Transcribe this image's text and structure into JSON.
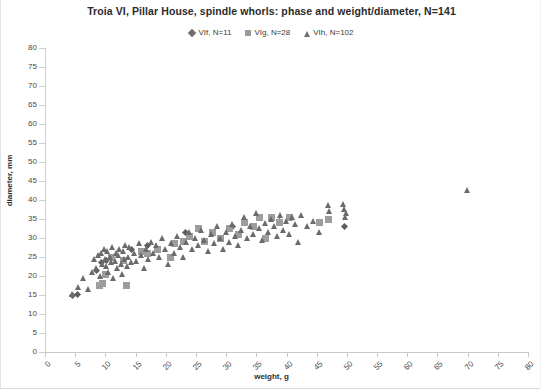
{
  "chart_data": {
    "type": "scatter",
    "title": "Troia VI, Pillar House, spindle whorls: phase and weight/diameter, N=141",
    "xlabel": "weight, g",
    "ylabel": "diameter, mm",
    "xlim": [
      0,
      80
    ],
    "ylim": [
      0,
      80
    ],
    "xticks": [
      0,
      5,
      10,
      15,
      20,
      25,
      30,
      35,
      40,
      45,
      50,
      55,
      60,
      65,
      70,
      75,
      80
    ],
    "yticks": [
      0,
      5,
      10,
      15,
      20,
      25,
      30,
      35,
      40,
      45,
      50,
      55,
      60,
      65,
      70,
      75,
      80
    ],
    "grid": false,
    "legend_position": "top-center",
    "colors": {
      "VIf": "#5d5d5d",
      "VIg": "#9d9d9d",
      "VIh": "#6b6b6b"
    },
    "series": [
      {
        "name": "VIf, N=11",
        "label": "VIf",
        "count": 11,
        "marker": "diamond",
        "color": "#5d5d5d",
        "points": [
          [
            4.6,
            15.0
          ],
          [
            5.4,
            15.2
          ],
          [
            8.6,
            21.5
          ],
          [
            9.4,
            23.5
          ],
          [
            10.2,
            24.0
          ],
          [
            14.4,
            27.0
          ],
          [
            17.0,
            28.0
          ],
          [
            23.3,
            31.5
          ],
          [
            31.0,
            33.0
          ],
          [
            38.8,
            34.3
          ],
          [
            49.6,
            33.0
          ]
        ]
      },
      {
        "name": "VIg, N=28",
        "label": "VIg",
        "count": 28,
        "marker": "square",
        "color": "#9d9d9d",
        "points": [
          [
            9.0,
            17.5
          ],
          [
            9.6,
            18.0
          ],
          [
            10.0,
            20.5
          ],
          [
            11.0,
            25.0
          ],
          [
            13.0,
            24.0
          ],
          [
            13.5,
            17.5
          ],
          [
            16.0,
            26.5
          ],
          [
            17.0,
            25.8
          ],
          [
            18.6,
            27.0
          ],
          [
            20.8,
            25.0
          ],
          [
            21.5,
            28.5
          ],
          [
            23.0,
            29.0
          ],
          [
            24.0,
            30.5
          ],
          [
            25.5,
            32.5
          ],
          [
            26.5,
            29.0
          ],
          [
            27.8,
            31.5
          ],
          [
            29.0,
            30.0
          ],
          [
            30.5,
            32.5
          ],
          [
            32.0,
            31.0
          ],
          [
            33.0,
            34.0
          ],
          [
            34.5,
            33.0
          ],
          [
            35.5,
            35.5
          ],
          [
            36.5,
            30.0
          ],
          [
            37.5,
            35.5
          ],
          [
            38.8,
            34.0
          ],
          [
            40.5,
            35.5
          ],
          [
            45.5,
            34.0
          ],
          [
            47.0,
            35.0
          ]
        ]
      },
      {
        "name": "VIh, N=102",
        "label": "VIh",
        "count": 102,
        "marker": "triangle",
        "color": "#6b6b6b",
        "points": [
          [
            4.5,
            15.2
          ],
          [
            5.6,
            17.0
          ],
          [
            6.4,
            19.5
          ],
          [
            7.2,
            16.5
          ],
          [
            7.8,
            21.0
          ],
          [
            8.2,
            24.5
          ],
          [
            8.6,
            22.0
          ],
          [
            8.9,
            25.5
          ],
          [
            9.2,
            20.0
          ],
          [
            9.4,
            26.0
          ],
          [
            9.6,
            23.0
          ],
          [
            9.8,
            27.0
          ],
          [
            10.0,
            24.5
          ],
          [
            10.2,
            22.5
          ],
          [
            10.4,
            26.5
          ],
          [
            10.6,
            21.0
          ],
          [
            10.8,
            25.0
          ],
          [
            11.0,
            23.5
          ],
          [
            11.2,
            27.5
          ],
          [
            11.4,
            19.5
          ],
          [
            11.6,
            24.0
          ],
          [
            11.8,
            26.0
          ],
          [
            12.0,
            22.0
          ],
          [
            12.2,
            25.5
          ],
          [
            12.4,
            27.0
          ],
          [
            12.6,
            23.0
          ],
          [
            12.8,
            20.5
          ],
          [
            13.0,
            26.5
          ],
          [
            13.2,
            24.5
          ],
          [
            13.4,
            28.0
          ],
          [
            13.6,
            22.5
          ],
          [
            13.8,
            25.0
          ],
          [
            14.0,
            27.5
          ],
          [
            14.4,
            23.5
          ],
          [
            14.8,
            26.0
          ],
          [
            15.2,
            24.0
          ],
          [
            15.6,
            28.5
          ],
          [
            16.0,
            25.5
          ],
          [
            16.4,
            22.0
          ],
          [
            16.8,
            27.0
          ],
          [
            17.2,
            24.5
          ],
          [
            17.6,
            29.0
          ],
          [
            18.0,
            26.0
          ],
          [
            18.5,
            28.0
          ],
          [
            19.0,
            25.0
          ],
          [
            19.5,
            30.0
          ],
          [
            20.0,
            27.0
          ],
          [
            20.5,
            23.0
          ],
          [
            21.0,
            28.5
          ],
          [
            21.5,
            26.0
          ],
          [
            22.0,
            30.5
          ],
          [
            22.5,
            27.5
          ],
          [
            23.0,
            25.0
          ],
          [
            23.5,
            29.0
          ],
          [
            24.0,
            31.5
          ],
          [
            24.5,
            27.0
          ],
          [
            25.0,
            30.0
          ],
          [
            25.5,
            28.0
          ],
          [
            26.0,
            32.0
          ],
          [
            26.5,
            29.5
          ],
          [
            27.0,
            26.5
          ],
          [
            27.5,
            31.0
          ],
          [
            28.0,
            28.5
          ],
          [
            28.5,
            33.0
          ],
          [
            29.0,
            30.0
          ],
          [
            29.5,
            27.0
          ],
          [
            30.0,
            31.5
          ],
          [
            30.5,
            29.0
          ],
          [
            31.0,
            33.5
          ],
          [
            31.5,
            30.5
          ],
          [
            32.0,
            28.0
          ],
          [
            32.5,
            32.0
          ],
          [
            33.0,
            35.5
          ],
          [
            33.5,
            30.0
          ],
          [
            34.0,
            33.0
          ],
          [
            34.5,
            31.0
          ],
          [
            35.0,
            36.5
          ],
          [
            35.5,
            32.5
          ],
          [
            36.0,
            29.5
          ],
          [
            36.5,
            34.0
          ],
          [
            37.0,
            31.5
          ],
          [
            37.5,
            35.0
          ],
          [
            38.0,
            33.0
          ],
          [
            38.5,
            30.5
          ],
          [
            39.0,
            36.0
          ],
          [
            39.5,
            32.0
          ],
          [
            40.0,
            34.5
          ],
          [
            40.5,
            31.0
          ],
          [
            41.0,
            35.5
          ],
          [
            41.5,
            33.5
          ],
          [
            42.0,
            29.0
          ],
          [
            42.5,
            36.0
          ],
          [
            43.5,
            33.0
          ],
          [
            44.5,
            34.5
          ],
          [
            45.5,
            31.5
          ],
          [
            47.0,
            38.5
          ],
          [
            47.2,
            37.0
          ],
          [
            49.5,
            39.0
          ],
          [
            49.6,
            37.5
          ],
          [
            49.8,
            35.5
          ],
          [
            50.0,
            36.5
          ],
          [
            70.0,
            42.5
          ]
        ]
      }
    ]
  }
}
